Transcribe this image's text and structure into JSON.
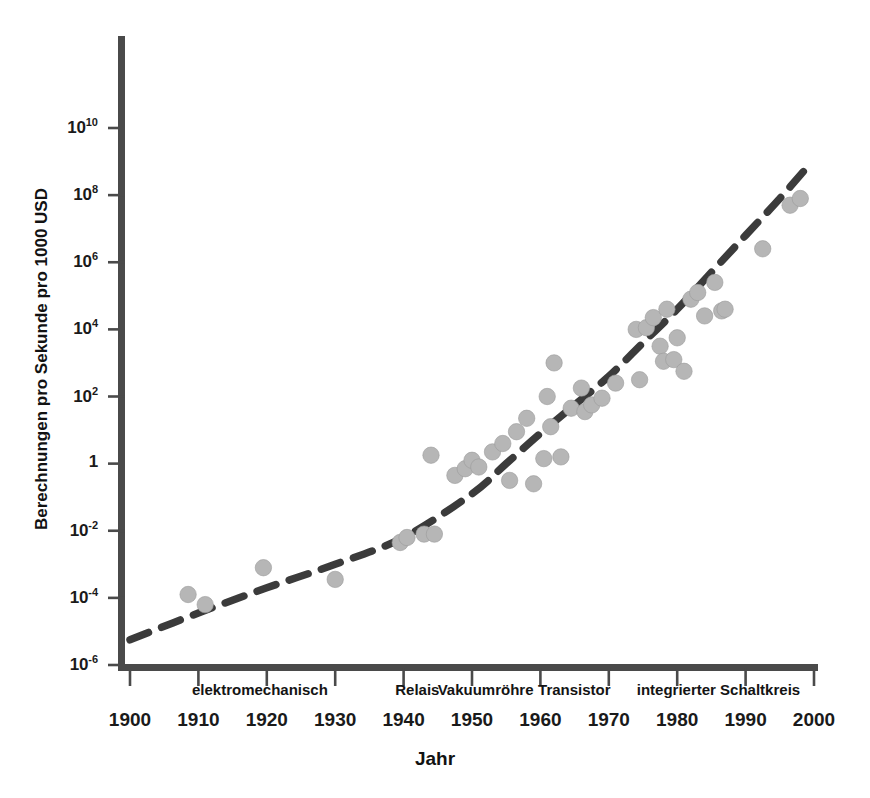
{
  "chart_data": {
    "type": "scatter",
    "title": "",
    "xlabel": "Jahr",
    "ylabel": "Berechnungen pro Sekunde pro 1000 USD",
    "xlim": [
      1900,
      2000
    ],
    "ylim_log10": [
      -6,
      11.5
    ],
    "yscale": "log",
    "grid": false,
    "legend": "none",
    "xticks": [
      "1900",
      "1910",
      "1920",
      "1930",
      "1940",
      "1950",
      "1960",
      "1970",
      "1980",
      "1990",
      "2000"
    ],
    "xtick_values": [
      1900,
      1910,
      1920,
      1930,
      1940,
      1950,
      1960,
      1970,
      1980,
      1990,
      2000
    ],
    "ytick_labels": [
      "10",
      "10",
      "10",
      "10",
      "10",
      "1",
      "10",
      "10",
      "10"
    ],
    "ytick_exponents": [
      "10",
      "8",
      "6",
      "4",
      "2",
      "",
      "-2",
      "-4",
      "-6"
    ],
    "ytick_log10": [
      10,
      8,
      6,
      4,
      2,
      0,
      -2,
      -4,
      -6
    ],
    "era_labels": [
      {
        "label": "elektromechanisch",
        "x_start": 1900,
        "x_end": 1938
      },
      {
        "label": "Relais",
        "x_start": 1938,
        "x_end": 1946
      },
      {
        "label": "Vakuumröhre",
        "x_start": 1946,
        "x_end": 1958
      },
      {
        "label": "Transistor",
        "x_start": 1958,
        "x_end": 1972
      },
      {
        "label": "integrierter Schaltkreis",
        "x_start": 1972,
        "x_end": 2000
      }
    ],
    "marker_color": "#b6b6b6",
    "trend_color": "#3b3b3b",
    "axis_color": "#4a4a4a",
    "points": [
      {
        "year": 1908.5,
        "log10": -3.9
      },
      {
        "year": 1911.0,
        "log10": -4.2
      },
      {
        "year": 1919.5,
        "log10": -3.1
      },
      {
        "year": 1930.0,
        "log10": -3.45
      },
      {
        "year": 1939.5,
        "log10": -2.35
      },
      {
        "year": 1940.5,
        "log10": -2.2
      },
      {
        "year": 1943.0,
        "log10": -2.1
      },
      {
        "year": 1944.5,
        "log10": -2.1
      },
      {
        "year": 1944.0,
        "log10": 0.25
      },
      {
        "year": 1947.5,
        "log10": -0.35
      },
      {
        "year": 1949.0,
        "log10": -0.15
      },
      {
        "year": 1950.0,
        "log10": 0.1
      },
      {
        "year": 1951.0,
        "log10": -0.1
      },
      {
        "year": 1953.0,
        "log10": 0.35
      },
      {
        "year": 1954.5,
        "log10": 0.6
      },
      {
        "year": 1955.5,
        "log10": -0.5
      },
      {
        "year": 1956.5,
        "log10": 0.95
      },
      {
        "year": 1958.0,
        "log10": 1.35
      },
      {
        "year": 1959.0,
        "log10": -0.6
      },
      {
        "year": 1960.5,
        "log10": 0.15
      },
      {
        "year": 1961.0,
        "log10": 2.0
      },
      {
        "year": 1961.5,
        "log10": 1.1
      },
      {
        "year": 1962.0,
        "log10": 3.0
      },
      {
        "year": 1963.0,
        "log10": 0.2
      },
      {
        "year": 1964.5,
        "log10": 1.65
      },
      {
        "year": 1966.0,
        "log10": 2.25
      },
      {
        "year": 1966.5,
        "log10": 1.55
      },
      {
        "year": 1967.5,
        "log10": 1.75
      },
      {
        "year": 1969.0,
        "log10": 1.95
      },
      {
        "year": 1971.0,
        "log10": 2.4
      },
      {
        "year": 1974.0,
        "log10": 4.0
      },
      {
        "year": 1974.5,
        "log10": 2.5
      },
      {
        "year": 1975.5,
        "log10": 4.05
      },
      {
        "year": 1976.5,
        "log10": 4.35
      },
      {
        "year": 1977.5,
        "log10": 3.5
      },
      {
        "year": 1978.0,
        "log10": 3.05
      },
      {
        "year": 1978.5,
        "log10": 4.6
      },
      {
        "year": 1979.5,
        "log10": 3.1
      },
      {
        "year": 1980.0,
        "log10": 3.75
      },
      {
        "year": 1981.0,
        "log10": 2.75
      },
      {
        "year": 1982.0,
        "log10": 4.9
      },
      {
        "year": 1983.0,
        "log10": 5.1
      },
      {
        "year": 1984.0,
        "log10": 4.4
      },
      {
        "year": 1985.5,
        "log10": 5.4
      },
      {
        "year": 1986.5,
        "log10": 4.55
      },
      {
        "year": 1987.0,
        "log10": 4.6
      },
      {
        "year": 1992.5,
        "log10": 6.4
      },
      {
        "year": 1996.5,
        "log10": 7.7
      },
      {
        "year": 1998.0,
        "log10": 7.9
      }
    ],
    "trend_curve": [
      {
        "year": 1900.0,
        "log10": -5.25
      },
      {
        "year": 1910.0,
        "log10": -4.45
      },
      {
        "year": 1920.0,
        "log10": -3.7
      },
      {
        "year": 1930.0,
        "log10": -3.0
      },
      {
        "year": 1940.0,
        "log10": -2.2
      },
      {
        "year": 1950.0,
        "log10": -0.9
      },
      {
        "year": 1955.0,
        "log10": 0.0
      },
      {
        "year": 1960.0,
        "log10": 0.9
      },
      {
        "year": 1965.0,
        "log10": 1.75
      },
      {
        "year": 1970.0,
        "log10": 2.6
      },
      {
        "year": 1975.0,
        "log10": 3.6
      },
      {
        "year": 1980.0,
        "log10": 4.6
      },
      {
        "year": 1985.0,
        "log10": 5.7
      },
      {
        "year": 1990.0,
        "log10": 6.8
      },
      {
        "year": 1995.0,
        "log10": 7.9
      },
      {
        "year": 1999.5,
        "log10": 8.95
      }
    ]
  }
}
